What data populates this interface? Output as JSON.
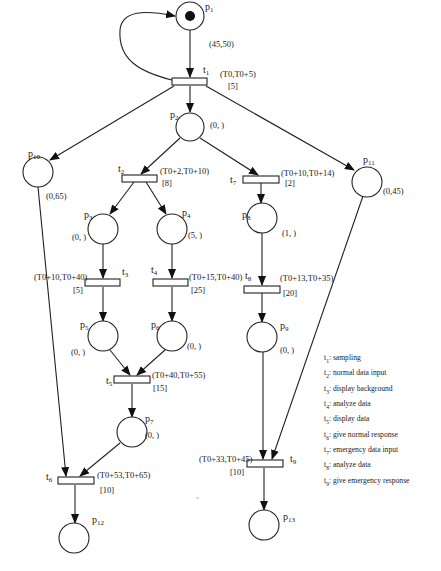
{
  "diagram": {
    "type": "timed-petri-net",
    "places": [
      {
        "id": "p1",
        "name": "p",
        "sub": "1",
        "interval": "(45,50)",
        "token": true
      },
      {
        "id": "p2",
        "name": "p",
        "sub": "2",
        "interval": "(0,  )"
      },
      {
        "id": "p3",
        "name": "p",
        "sub": "3",
        "interval": "(0,  )"
      },
      {
        "id": "p4",
        "name": "p",
        "sub": "4",
        "interval": "(5,  )"
      },
      {
        "id": "p5",
        "name": "p",
        "sub": "5",
        "interval": "(0,  )"
      },
      {
        "id": "p6",
        "name": "p",
        "sub": "6",
        "interval": "(0,  )"
      },
      {
        "id": "p7",
        "name": "p",
        "sub": "7",
        "interval": "(0,  )"
      },
      {
        "id": "p8",
        "name": "p",
        "sub": "8",
        "interval": "(1,  )"
      },
      {
        "id": "p9",
        "name": "p",
        "sub": "9",
        "interval": "(0,  )"
      },
      {
        "id": "p10",
        "name": "p",
        "sub": "10",
        "interval": "(0,65)"
      },
      {
        "id": "p11",
        "name": "p",
        "sub": "11",
        "interval": "(0,45)"
      },
      {
        "id": "p12",
        "name": "p",
        "sub": "12",
        "interval": ""
      },
      {
        "id": "p13",
        "name": "p",
        "sub": "13",
        "interval": ""
      }
    ],
    "transitions": [
      {
        "id": "t1",
        "name": "t",
        "sub": "1",
        "window": "(T0,T0+5)",
        "duration": "[5]"
      },
      {
        "id": "t2",
        "name": "t",
        "sub": "2",
        "window": "(T0+2,T0+10)",
        "duration": "[8]"
      },
      {
        "id": "t3",
        "name": "t",
        "sub": "3",
        "window": "(T0+10,T0+40)",
        "duration": "[5]"
      },
      {
        "id": "t4",
        "name": "t",
        "sub": "4",
        "window": "(T0+15,T0+40)",
        "duration": "[25]"
      },
      {
        "id": "t5",
        "name": "t",
        "sub": "5",
        "window": "(T0+40,T0+55)",
        "duration": "[15]"
      },
      {
        "id": "t6",
        "name": "t",
        "sub": "6",
        "window": "(T0+53,T0+65)",
        "duration": "[10]"
      },
      {
        "id": "t7",
        "name": "t",
        "sub": "7",
        "window": "(T0+10,T0+14)",
        "duration": "[2]"
      },
      {
        "id": "t8",
        "name": "t",
        "sub": "8",
        "window": "(T0+13,T0+35)",
        "duration": "[20]"
      },
      {
        "id": "t9",
        "name": "t",
        "sub": "9",
        "window": "(T0+33,T0+45)",
        "duration": "[10]"
      }
    ],
    "arcs": [
      [
        "t1",
        "p1"
      ],
      [
        "p1",
        "t1"
      ],
      [
        "t1",
        "p2"
      ],
      [
        "t1",
        "p10"
      ],
      [
        "t1",
        "p11"
      ],
      [
        "p2",
        "t2"
      ],
      [
        "p2",
        "t7"
      ],
      [
        "t2",
        "p3"
      ],
      [
        "t2",
        "p4"
      ],
      [
        "p3",
        "t3"
      ],
      [
        "p4",
        "t4"
      ],
      [
        "t3",
        "p5"
      ],
      [
        "t4",
        "p6"
      ],
      [
        "p5",
        "t5"
      ],
      [
        "p6",
        "t5"
      ],
      [
        "t5",
        "p7"
      ],
      [
        "p7",
        "t6"
      ],
      [
        "p10",
        "t6"
      ],
      [
        "t6",
        "p12"
      ],
      [
        "t7",
        "p8"
      ],
      [
        "p8",
        "t8"
      ],
      [
        "t8",
        "p9"
      ],
      [
        "p9",
        "t9"
      ],
      [
        "p11",
        "t9"
      ],
      [
        "t9",
        "p13"
      ]
    ]
  },
  "legend": [
    {
      "t": "t",
      "sub": "1",
      "text": ": sampling"
    },
    {
      "t": "t",
      "sub": "2",
      "text": ": normal data input"
    },
    {
      "t": "t",
      "sub": "3",
      "text": ": display background"
    },
    {
      "t": "t",
      "sub": "4",
      "text": ": analyze data"
    },
    {
      "t": "t",
      "sub": "5",
      "text": ": display data"
    },
    {
      "t": "t",
      "sub": "6",
      "text": ": give normal response"
    },
    {
      "t": "t",
      "sub": "7",
      "text": ": emergency data input"
    },
    {
      "t": "t",
      "sub": "8",
      "text": ": analyze data"
    },
    {
      "t": "t",
      "sub": "9",
      "text": ": give emergency response"
    }
  ]
}
